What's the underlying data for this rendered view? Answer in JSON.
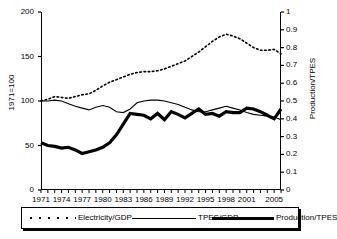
{
  "chart_data": {
    "type": "line",
    "title": "",
    "xlabel": "",
    "ylabel": "1971=100",
    "ylabel_right": "Production/TPES",
    "xlim": [
      1971,
      2006
    ],
    "ylim": [
      0,
      200
    ],
    "ylim_right": [
      0,
      1
    ],
    "grid": false,
    "legend_position": "bottom",
    "x": [
      1971,
      1972,
      1973,
      1974,
      1975,
      1976,
      1977,
      1978,
      1979,
      1980,
      1981,
      1982,
      1983,
      1984,
      1985,
      1986,
      1987,
      1988,
      1989,
      1990,
      1991,
      1992,
      1993,
      1994,
      1995,
      1996,
      1997,
      1998,
      1999,
      2000,
      2001,
      2002,
      2003,
      2004,
      2005,
      2006
    ],
    "xticks": [
      1971,
      1974,
      1977,
      1980,
      1983,
      1986,
      1989,
      1992,
      1995,
      1998,
      2001,
      2005
    ],
    "yticks_left": [
      0,
      50,
      100,
      150,
      200
    ],
    "yticks_right": [
      0,
      0.1,
      0.2,
      0.3,
      0.4,
      0.5,
      0.6,
      0.7,
      0.8,
      0.9,
      1
    ],
    "series": [
      {
        "name": "Electricity/GDP",
        "axis": "left",
        "style": "dotted",
        "values": [
          100,
          102,
          105,
          104,
          103,
          105,
          107,
          108,
          112,
          117,
          121,
          124,
          127,
          130,
          132,
          133,
          133,
          134,
          136,
          139,
          142,
          145,
          150,
          155,
          161,
          167,
          172,
          175,
          173,
          170,
          165,
          160,
          157,
          157,
          158,
          153
        ]
      },
      {
        "name": "TPES/GDP",
        "axis": "left",
        "style": "thin-solid",
        "values": [
          100,
          100,
          101,
          100,
          97,
          94,
          92,
          90,
          93,
          95,
          93,
          88,
          87,
          91,
          98,
          100,
          101,
          101,
          100,
          98,
          96,
          93,
          90,
          88,
          88,
          90,
          92,
          94,
          92,
          90,
          87,
          85,
          84,
          83,
          82,
          79
        ]
      },
      {
        "name": "Production/TPES",
        "axis": "right",
        "style": "thick-solid",
        "values": [
          0.265,
          0.25,
          0.245,
          0.235,
          0.24,
          0.225,
          0.205,
          0.215,
          0.225,
          0.24,
          0.265,
          0.31,
          0.37,
          0.43,
          0.425,
          0.42,
          0.4,
          0.43,
          0.395,
          0.44,
          0.425,
          0.405,
          0.43,
          0.455,
          0.425,
          0.43,
          0.415,
          0.44,
          0.435,
          0.435,
          0.46,
          0.455,
          0.44,
          0.42,
          0.4,
          0.455
        ]
      }
    ]
  },
  "legend": {
    "items": [
      {
        "label": "Electricity/GDP",
        "swatch": "dotted-line"
      },
      {
        "label": "TPES/GDP",
        "swatch": "thin-line"
      },
      {
        "label": "Production/TPES",
        "swatch": "thick-line"
      }
    ]
  },
  "colors": {
    "series_line": "#000000",
    "axis": "#000000",
    "background": "#ffffff"
  }
}
